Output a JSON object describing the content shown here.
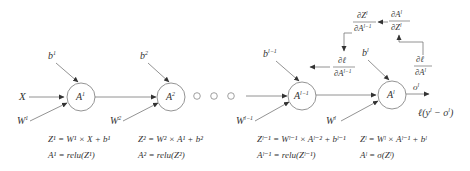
{
  "inputs": {
    "x_label": "X",
    "w1_label": "W",
    "w1_sup": "1",
    "b1_label": "b",
    "b1_sup": "1",
    "w2_label": "W",
    "w2_sup": "2",
    "b2_label": "b",
    "b2_sup": "2",
    "wl1_label": "W",
    "wl1_sup": "l−1",
    "bl1_label": "b",
    "bl1_sup": "l−1",
    "wl_label": "W",
    "wl_sup": "l",
    "bl_label": "b",
    "bl_sup": "l"
  },
  "nodes": [
    {
      "id": "A1",
      "label": "A",
      "sup": "1"
    },
    {
      "id": "A2",
      "label": "A",
      "sup": "2"
    },
    {
      "id": "Al-1",
      "label": "A",
      "sup": "l−1"
    },
    {
      "id": "Al",
      "label": "A",
      "sup": "l"
    }
  ],
  "output": {
    "label": "o",
    "sup": "l",
    "loss": "ℓ(y",
    "loss_sup1": "l",
    "loss_mid": " − o",
    "loss_sup2": "l",
    "loss_end": ")"
  },
  "gradients": {
    "dA_dZ": {
      "num": "∂A",
      "num_sup": "l",
      "den": "∂Z",
      "den_sup": "l"
    },
    "dZ_dA": {
      "num": "∂Z",
      "num_sup": "l",
      "den": "∂A",
      "den_sup": "l−1"
    },
    "dl_dA": {
      "num": "∂ℓ",
      "den": "∂A",
      "den_sup": "l"
    },
    "dl_dAprev": {
      "num": "∂ℓ",
      "den": "∂A",
      "den_sup": "l−1"
    }
  },
  "equations": [
    {
      "z": "Z¹ = W¹ × X + b¹",
      "a": "A¹ = relu(Z¹)"
    },
    {
      "z": "Z² = W² × A¹ + b²",
      "a": "A² = relu(Z²)"
    },
    {
      "z": "Zˡ⁻¹ = Wˡ⁻¹ × Aˡ⁻² + bˡ⁻¹",
      "a": "Aˡ⁻¹ = relu(Zˡ⁻¹)"
    },
    {
      "z": "Zˡ = Wˡ × Aˡ⁻¹ + bˡ",
      "a": "Aˡ = σ(Zˡ)"
    }
  ],
  "colors": {
    "line": "#777777",
    "text": "#333333",
    "background": "#ffffff"
  }
}
